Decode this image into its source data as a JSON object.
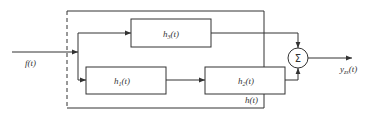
{
  "diagram": {
    "type": "block-diagram",
    "input": {
      "label": "f",
      "arg": "(t)"
    },
    "output": {
      "label": "y",
      "sub": "zs",
      "arg": "(t)"
    },
    "system": {
      "label": "h",
      "arg": "(t)"
    },
    "blocks": [
      {
        "id": "h3",
        "label": "h",
        "sub": "3",
        "arg": "(t)"
      },
      {
        "id": "h1",
        "label": "h",
        "sub": "1",
        "arg": "(t)"
      },
      {
        "id": "h2",
        "label": "h",
        "sub": "2",
        "arg": "(t)"
      }
    ],
    "summer": {
      "symbol": "Σ"
    },
    "colors": {
      "line": "#333333",
      "background": "#ffffff"
    }
  }
}
